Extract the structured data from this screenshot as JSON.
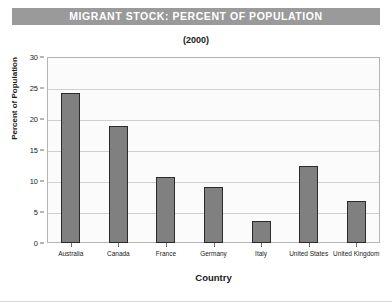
{
  "title": "MIGRANT STOCK: PERCENT OF POPULATION",
  "subtitle": "(2000)",
  "colors": {
    "title_banner_bg": "#9a9a9a",
    "title_text": "#ffffff",
    "bar_fill": "#808080",
    "bar_edge": "#2b2b2b",
    "grid": "#cfcfcf",
    "plot_bg": "#fbfbfb",
    "axis": "#b4b4b4"
  },
  "chart_data": {
    "type": "bar",
    "title": "MIGRANT STOCK: PERCENT OF POPULATION",
    "subtitle": "(2000)",
    "xlabel": "Country",
    "ylabel": "Percent of Population",
    "categories": [
      "Australia",
      "Canada",
      "France",
      "Germany",
      "Italy",
      "United States",
      "United Kingdom"
    ],
    "values": [
      24.2,
      18.9,
      10.7,
      9.1,
      3.6,
      12.4,
      6.8
    ],
    "ylim": [
      0,
      30
    ],
    "yticks": [
      0,
      5,
      10,
      15,
      20,
      25,
      30
    ],
    "ytick_labels": [
      "0",
      "5",
      "10",
      "15",
      "20",
      "25",
      "30"
    ],
    "grid": true,
    "grid_axis": "y",
    "legend": false
  }
}
